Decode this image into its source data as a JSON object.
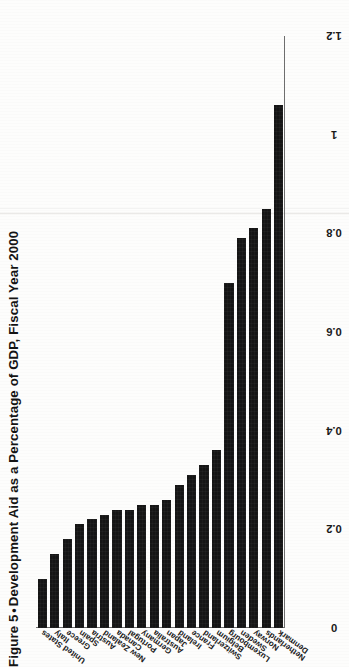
{
  "figure": {
    "label": "Figure 5",
    "separator": "•",
    "title": "Development Aid as a Percentage of GDP, Fiscal Year 2000",
    "full_title": "Figure 5 • Development Aid as a Percentage of GDP, Fiscal Year 2000"
  },
  "chart_data": {
    "type": "bar",
    "orientation": "horizontal",
    "xlabel": "",
    "ylabel": "",
    "xlim": [
      0,
      1.2
    ],
    "grid": false,
    "legend": null,
    "bar_color": "#151515",
    "axis_color": "#6e6e6e",
    "tick_labels": [
      "1.2",
      "1",
      "0.8",
      "0.6",
      "0.4",
      "0.2",
      "0"
    ],
    "tick_values": [
      1.2,
      1,
      0.8,
      0.6,
      0.4,
      0.2,
      0
    ],
    "categories": [
      "Denmark",
      "Netherlands",
      "Norway",
      "Sweden",
      "Luxembourg",
      "Belgium",
      "Switzerland",
      "France",
      "Ireland",
      "Japan",
      "Australia",
      "Germany",
      "Portugal",
      "Canada",
      "New Zealand",
      "Austria",
      "Spain",
      "Greece",
      "Italy",
      "United States"
    ],
    "values": [
      1.06,
      0.85,
      0.81,
      0.79,
      0.7,
      0.36,
      0.33,
      0.31,
      0.29,
      0.26,
      0.25,
      0.25,
      0.24,
      0.24,
      0.23,
      0.22,
      0.21,
      0.18,
      0.15,
      0.1
    ],
    "value_unit": "percent of GDP"
  }
}
